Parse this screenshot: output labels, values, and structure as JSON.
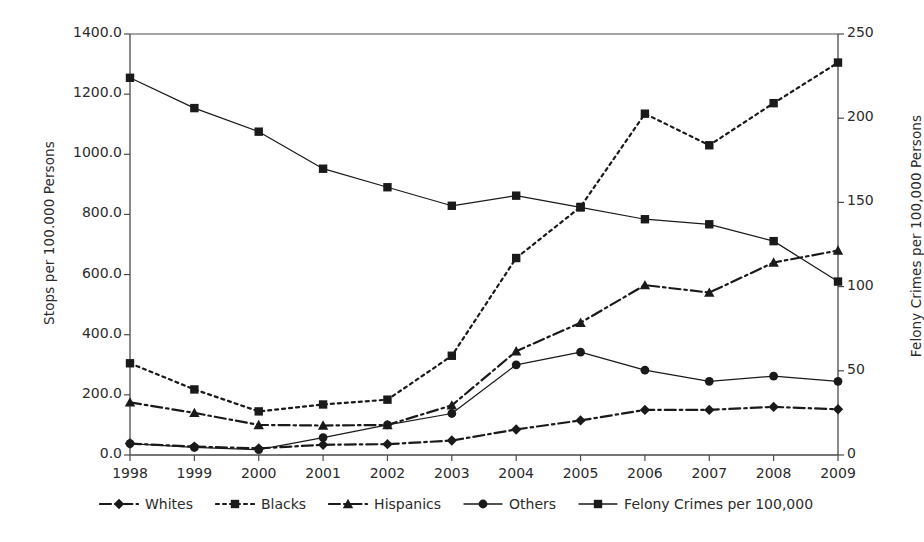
{
  "chart_data": {
    "type": "line",
    "title": "",
    "xlabel": "",
    "ylabel": "Stops per 100.000 Persons",
    "y2label": "Felony Crimes per 100,000 Persons",
    "categories": [
      "1998",
      "1999",
      "2000",
      "2001",
      "2002",
      "2003",
      "2004",
      "2005",
      "2006",
      "2007",
      "2008",
      "2009"
    ],
    "x": [
      1998,
      1999,
      2000,
      2001,
      2002,
      2003,
      2004,
      2005,
      2006,
      2007,
      2008,
      2009
    ],
    "ylim": [
      0,
      1400
    ],
    "y2lim": [
      0,
      250
    ],
    "yticks": [
      "0.0",
      "200.0",
      "400.0",
      "600.0",
      "800.0",
      "1000.0",
      "1200.0",
      "1400.0"
    ],
    "ytick_values": [
      0,
      200,
      400,
      600,
      800,
      1000,
      1200,
      1400
    ],
    "y2ticks": [
      "0",
      "50",
      "100",
      "150",
      "200",
      "250"
    ],
    "y2tick_values": [
      0,
      50,
      100,
      150,
      200,
      250
    ],
    "grid": false,
    "legend_position": "bottom",
    "series": [
      {
        "name": "Whites",
        "axis": "left",
        "marker": "diamond",
        "linestyle": "dashdot",
        "values": [
          38,
          28,
          22,
          34,
          36,
          48,
          85,
          115,
          150,
          150,
          160,
          152
        ]
      },
      {
        "name": "Blacks",
        "axis": "left",
        "marker": "square",
        "linestyle": "dotted",
        "values": [
          305,
          218,
          145,
          168,
          184,
          330,
          655,
          1135,
          1030,
          1170,
          1305,
          1305
        ]
      },
      {
        "name": "Hispanics",
        "axis": "left",
        "marker": "triangle",
        "linestyle": "dashdot",
        "values": [
          175,
          140,
          100,
          98,
          100,
          165,
          345,
          440,
          565,
          540,
          640,
          680
        ]
      },
      {
        "name": "Others",
        "axis": "left",
        "marker": "circle",
        "linestyle": "solid",
        "values": [
          38,
          25,
          18,
          58,
          100,
          138,
          300,
          342,
          282,
          245,
          262,
          245
        ]
      },
      {
        "name": "Felony Crimes per 100,000",
        "axis": "right",
        "marker": "square",
        "linestyle": "solid",
        "values": [
          224,
          206,
          192,
          170,
          159,
          148,
          154,
          147,
          140,
          137,
          127,
          103
        ]
      }
    ],
    "series_order_note": "Blacks values are plotted by year index: 1998-2009",
    "blacks_by_year": {
      "1998": 305,
      "1999": 218,
      "2000": 145,
      "2001": 168,
      "2002": 184,
      "2003": 330,
      "2004": 655,
      "2005": 825,
      "2006": 1135,
      "2007": 1030,
      "2008": 1170,
      "2009": 1305
    }
  },
  "legend": {
    "items": [
      {
        "label": "Whites",
        "marker": "diamond",
        "linestyle": "dashdot"
      },
      {
        "label": "Blacks",
        "marker": "square",
        "linestyle": "dotted"
      },
      {
        "label": "Hispanics",
        "marker": "triangle",
        "linestyle": "dashdot"
      },
      {
        "label": "Others",
        "marker": "circle",
        "linestyle": "solid"
      },
      {
        "label": "Felony Crimes per 100,000",
        "marker": "square",
        "linestyle": "solid"
      }
    ]
  },
  "colors": {
    "line": "#1a1a1a",
    "axis": "#4a4a4a",
    "text": "#2b2b2b",
    "background": "#ffffff"
  }
}
